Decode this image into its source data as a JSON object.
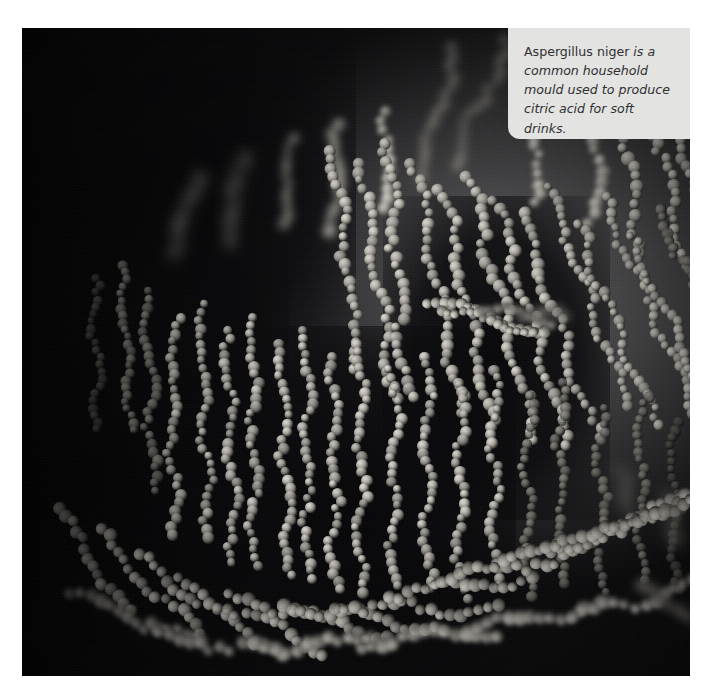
{
  "figure": {
    "name": "aspergillus-niger-micrograph",
    "alt_description": "Scanning electron micrograph of Aspergillus niger showing dense branching chains of rough-surfaced spherical conidia against a dark grey background",
    "subject": "Aspergillus niger",
    "photo_background_color": "#3a3a3e",
    "page_background_color": "#ffffff"
  },
  "callout": {
    "background_color": "#e3e3e1",
    "text_color": "#2f3032",
    "species_name": "Aspergillus niger",
    "lead_word": " is",
    "body": " a common household mould used to produce citric acid for soft drinks.",
    "full_text": "Aspergillus niger is a common household mould used to produce citric acid for soft drinks.",
    "lines": [
      "Aspergillus niger is",
      "a common household",
      "mould used to produce",
      "citric acid for soft drinks."
    ]
  }
}
